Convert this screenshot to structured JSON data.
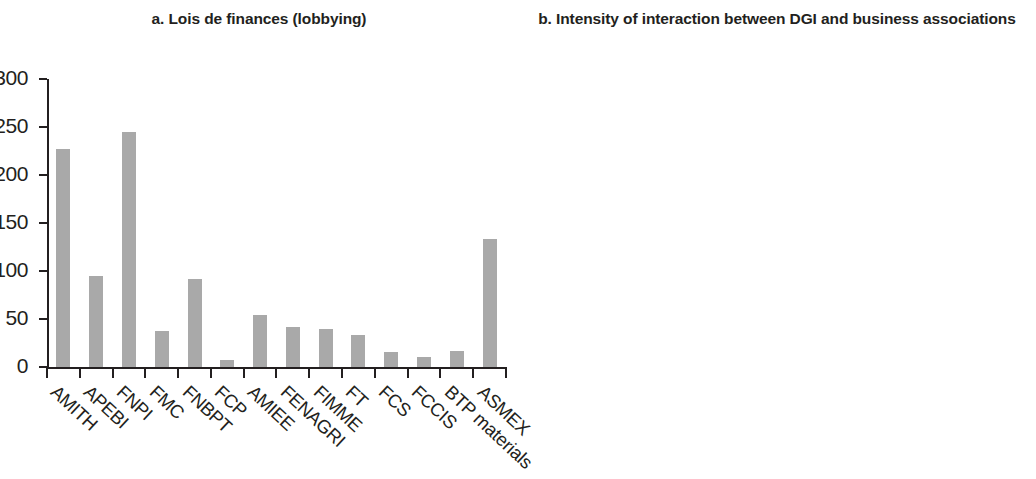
{
  "figure": {
    "panels": [
      {
        "id": "a",
        "title": "a. Lois de finances (lobbying)"
      },
      {
        "id": "b",
        "title": "b. Intensity of interaction between DGI and business associations"
      }
    ],
    "bar_color": "#a9a9a9",
    "axis_color": "#231f20"
  },
  "chart_data": [
    {
      "type": "bar",
      "title": "a. Lois de finances (lobbying)",
      "xlabel": "",
      "ylabel": "",
      "ylim": [
        0,
        300
      ],
      "yticks": [
        0,
        50,
        100,
        150,
        200,
        250,
        300
      ],
      "grid": false,
      "legend": null,
      "categories": [
        "AMITH",
        "APEBI",
        "FNPI",
        "FMC",
        "FNBPT",
        "FCP",
        "AMIEE",
        "FENAGRI",
        "FIMME",
        "FT",
        "FCS",
        "FCCIS",
        "BTP materials",
        "ASMEX"
      ],
      "values": [
        227,
        95,
        245,
        37,
        92,
        7,
        54,
        42,
        40,
        33,
        16,
        10,
        17,
        133
      ]
    },
    {
      "type": "bar",
      "title": "b. Intensity of interaction between DGI and business associations",
      "xlabel": "",
      "ylabel": "",
      "ylim": [
        0,
        50
      ],
      "yticks": [
        0,
        5,
        10,
        15,
        20,
        25,
        30,
        35,
        40,
        45,
        50
      ],
      "grid": false,
      "legend": null,
      "categories": [
        "AMITH",
        "APEBI",
        "FNPI",
        "FMC",
        "FNBPT",
        "FCP",
        "AMIEE",
        "FENAGRI",
        "FIMME",
        "FT",
        "FCS",
        "FCCIS",
        "BTP materials",
        "ASMEX"
      ],
      "values": [
        4,
        2,
        43,
        2,
        3,
        1,
        2,
        7,
        1,
        14,
        1,
        4,
        0,
        9
      ]
    }
  ]
}
